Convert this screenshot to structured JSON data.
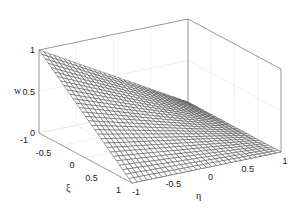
{
  "chart_data": {
    "type": "surface",
    "title": "",
    "xlabel": "ξ",
    "ylabel": "η",
    "zlabel": "w",
    "x_ticks": [
      "-1",
      "-0.5",
      "0",
      "0.5",
      "1"
    ],
    "y_ticks": [
      "-1",
      "-0.5",
      "0",
      "0.5",
      "1"
    ],
    "z_ticks": [
      "0",
      "0.5",
      "1"
    ],
    "xlim": [
      -1,
      1
    ],
    "ylim": [
      -1,
      1
    ],
    "zlim": [
      0,
      1
    ],
    "grid": true,
    "mesh_divisions": 30,
    "function": "w = (1-ξ)(1-η)/4",
    "corner_values": [
      {
        "xi": -1,
        "eta": -1,
        "w": 1
      },
      {
        "xi": 1,
        "eta": -1,
        "w": 0
      },
      {
        "xi": -1,
        "eta": 1,
        "w": 0
      },
      {
        "xi": 1,
        "eta": 1,
        "w": 0
      }
    ],
    "colors": {
      "mesh": "#333333",
      "face": "#ffffff",
      "box": "#777777",
      "grid": "#e4e4e4"
    }
  }
}
